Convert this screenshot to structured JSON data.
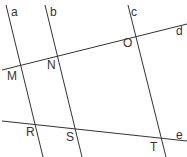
{
  "diagram": {
    "lines": [
      {
        "name": "a",
        "x1": 6,
        "y1": 5,
        "x2": 43,
        "y2": 157
      },
      {
        "name": "b",
        "x1": 45,
        "y1": 5,
        "x2": 82,
        "y2": 157
      },
      {
        "name": "c",
        "x1": 128,
        "y1": 5,
        "x2": 166,
        "y2": 157
      },
      {
        "name": "d",
        "x1": 2,
        "y1": 70,
        "x2": 187,
        "y2": 24
      },
      {
        "name": "e",
        "x1": 2,
        "y1": 121,
        "x2": 187,
        "y2": 141
      }
    ],
    "line_labels": [
      {
        "text": "a",
        "x": 11,
        "y": 6
      },
      {
        "text": "b",
        "x": 50,
        "y": 6
      },
      {
        "text": "c",
        "x": 131,
        "y": 6
      },
      {
        "text": "d",
        "x": 176,
        "y": 25
      },
      {
        "text": "e",
        "x": 176,
        "y": 129
      }
    ],
    "point_labels": [
      {
        "text": "M",
        "x": 7,
        "y": 70
      },
      {
        "text": "N",
        "x": 47,
        "y": 59
      },
      {
        "text": "O",
        "x": 123,
        "y": 37
      },
      {
        "text": "R",
        "x": 26,
        "y": 126
      },
      {
        "text": "S",
        "x": 66,
        "y": 131
      },
      {
        "text": "T",
        "x": 150,
        "y": 141
      }
    ],
    "stroke_color": "#333333"
  }
}
